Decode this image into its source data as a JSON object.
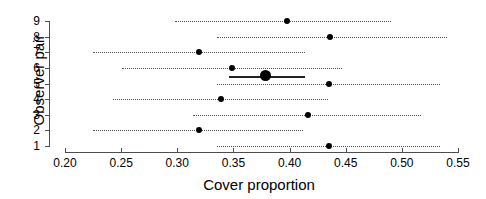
{
  "chart_data": {
    "type": "scatter",
    "title": "",
    "xlabel": "Cover proportion",
    "ylabel": "Observer pair",
    "xlim": [
      0.2,
      0.55
    ],
    "ylim": [
      1,
      9
    ],
    "grid": false,
    "legend": null,
    "xticks": [
      "0.20",
      "0.25",
      "0.30",
      "0.35",
      "0.40",
      "0.45",
      "0.50",
      "0.55"
    ],
    "xtick_values": [
      0.2,
      0.25,
      0.3,
      0.35,
      0.4,
      0.45,
      0.5,
      0.55
    ],
    "yticks": [
      "9",
      "8",
      "7",
      "6",
      "5",
      "4",
      "3",
      "2",
      "1"
    ],
    "ytick_values": [
      9,
      8,
      7,
      6,
      5,
      4,
      3,
      2,
      1
    ],
    "series": [
      {
        "name": "Observer pair estimate with confidence interval",
        "points": [
          {
            "label": "9",
            "y": 9,
            "estimate": 0.398,
            "ci_low": 0.298,
            "ci_high": 0.49,
            "style": "dotted"
          },
          {
            "label": "8",
            "y": 8,
            "estimate": 0.436,
            "ci_low": 0.335,
            "ci_high": 0.54,
            "style": "dotted"
          },
          {
            "label": "7",
            "y": 7,
            "estimate": 0.319,
            "ci_low": 0.225,
            "ci_high": 0.414,
            "style": "dotted"
          },
          {
            "label": "6",
            "y": 6,
            "estimate": 0.349,
            "ci_low": 0.251,
            "ci_high": 0.447,
            "style": "dotted"
          },
          {
            "label": "5",
            "y": 5,
            "estimate": 0.435,
            "ci_low": 0.335,
            "ci_high": 0.534,
            "style": "dotted"
          },
          {
            "label": "4",
            "y": 4,
            "estimate": 0.339,
            "ci_low": 0.243,
            "ci_high": 0.434,
            "style": "dotted"
          },
          {
            "label": "3",
            "y": 3,
            "estimate": 0.416,
            "ci_low": 0.314,
            "ci_high": 0.517,
            "style": "dotted"
          },
          {
            "label": "2",
            "y": 2,
            "estimate": 0.319,
            "ci_low": 0.225,
            "ci_high": 0.412,
            "style": "dotted"
          },
          {
            "label": "1",
            "y": 1,
            "estimate": 0.435,
            "ci_low": 0.335,
            "ci_high": 0.534,
            "style": "dotted"
          }
        ]
      },
      {
        "name": "Pooled summary estimate",
        "points": [
          {
            "label": "summary",
            "y": 5.5,
            "estimate": 0.379,
            "ci_low": 0.346,
            "ci_high": 0.414,
            "style": "solid"
          }
        ]
      }
    ],
    "colors": {
      "point": "#000000",
      "interval": "#555555",
      "summary": "#222222",
      "axis": "#4d4d4d",
      "background": "#ffffff"
    }
  }
}
